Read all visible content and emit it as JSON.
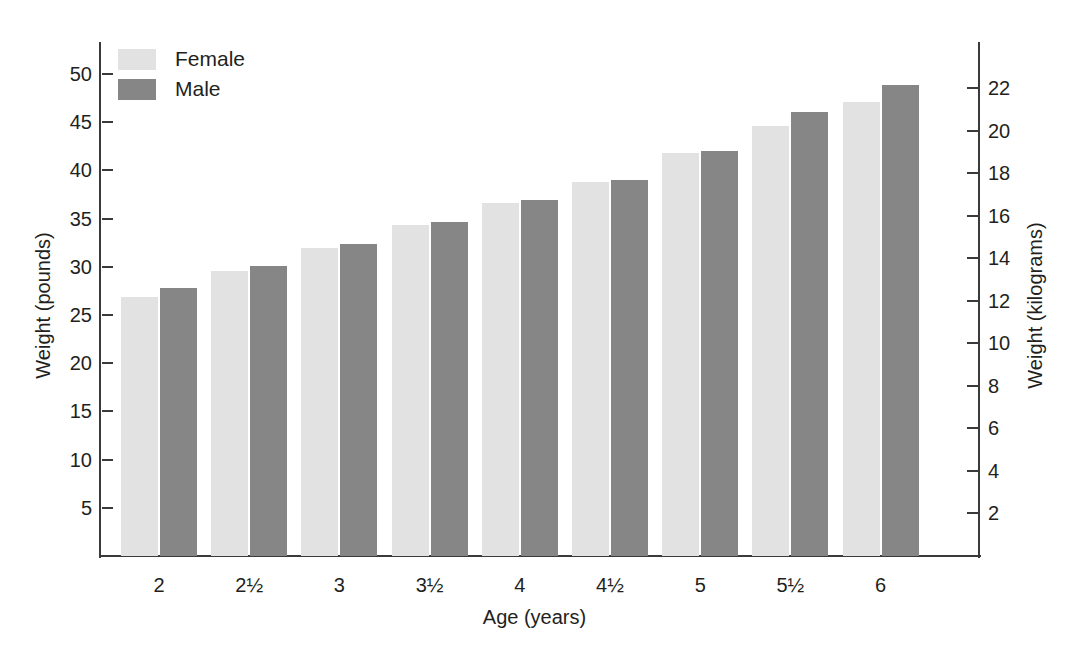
{
  "chart_data": {
    "type": "bar",
    "title": "",
    "xlabel": "Age (years)",
    "ylabel": "Weight (pounds)",
    "ylabel_secondary": "Weight (kilograms)",
    "categories": [
      "2",
      "2½",
      "3",
      "3½",
      "4",
      "4½",
      "5",
      "5½",
      "6"
    ],
    "series": [
      {
        "name": "Female",
        "color": "#e2e2e2",
        "values": [
          26.9,
          29.6,
          31.9,
          34.3,
          36.6,
          38.8,
          41.8,
          44.6,
          47.1
        ]
      },
      {
        "name": "Male",
        "color": "#868686",
        "values": [
          27.8,
          30.1,
          32.4,
          34.6,
          36.9,
          39.0,
          42.0,
          46.1,
          48.9
        ]
      }
    ],
    "ylim": [
      0,
      52
    ],
    "yticks": [
      "5",
      "10",
      "15",
      "20",
      "25",
      "30",
      "35",
      "40",
      "45",
      "50"
    ],
    "ytick_values": [
      5,
      10,
      15,
      20,
      25,
      30,
      35,
      40,
      45,
      50
    ],
    "ylim_secondary": [
      0,
      23.6
    ],
    "yticks_secondary": [
      "2",
      "4",
      "6",
      "8",
      "10",
      "12",
      "14",
      "16",
      "18",
      "20",
      "22"
    ],
    "ytick_values_secondary": [
      2,
      4,
      6,
      8,
      10,
      12,
      14,
      16,
      18,
      20,
      22
    ],
    "grid": false,
    "legend_position": "top-left",
    "legend": [
      {
        "label": "Female",
        "color": "#e2e2e2"
      },
      {
        "label": "Male",
        "color": "#868686"
      }
    ]
  }
}
